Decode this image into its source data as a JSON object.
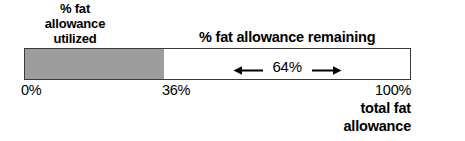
{
  "figure": {
    "left_caption": {
      "line1": "% fat",
      "line2": "allowance",
      "line3": "utilized"
    },
    "remaining_caption": "% fat allowance remaining",
    "measure": {
      "left_arrow_icon": "arrow-left-icon",
      "value_label": "64%",
      "right_arrow_icon": "arrow-right-icon"
    },
    "ticks": {
      "start": "0%",
      "middle": "36%",
      "end": "100%"
    },
    "right_caption": {
      "line1": "total fat",
      "line2": "allowance"
    },
    "colors": {
      "fill": "#9d9d9d",
      "border": "#3a3a3a",
      "track": "#ffffff",
      "text": "#000000"
    }
  },
  "chart_data": {
    "type": "bar",
    "orientation": "horizontal",
    "categories": [
      "% fat allowance utilized",
      "% fat allowance remaining"
    ],
    "values": [
      36,
      64
    ],
    "unit": "%",
    "xlabel": "total fat allowance",
    "ylabel": "",
    "xlim": [
      0,
      100
    ],
    "tick_values": [
      0,
      36,
      100
    ],
    "tick_labels": [
      "0%",
      "36%",
      "100%"
    ],
    "annotations": [
      "64%"
    ],
    "grid": false,
    "legend": "none",
    "stacked": true
  }
}
